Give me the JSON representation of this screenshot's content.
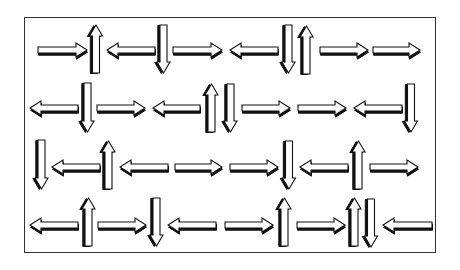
{
  "diagram": {
    "title": "",
    "colors": {
      "fill": "#ffffff",
      "outline": "#111111",
      "shadow": "#111111",
      "frame": "#333333",
      "background": "#ffffff"
    },
    "frame": {
      "x": 24,
      "y": 17,
      "w": 412,
      "h": 236
    },
    "rows": [
      {
        "cy": 50,
        "arrows": [
          {
            "dir": "right",
            "x0": 38,
            "x1": 87
          },
          {
            "dir": "up",
            "x0": 90,
            "x1": 102,
            "y0": 25,
            "y1": 73
          },
          {
            "dir": "left",
            "x0": 107,
            "x1": 155
          },
          {
            "dir": "down",
            "x0": 157,
            "x1": 170,
            "y0": 25,
            "y1": 73
          },
          {
            "dir": "right",
            "x0": 173,
            "x1": 222
          },
          {
            "dir": "left",
            "x0": 230,
            "x1": 278
          },
          {
            "dir": "down",
            "x0": 282,
            "x1": 295,
            "y0": 25,
            "y1": 73
          },
          {
            "dir": "up",
            "x0": 300,
            "x1": 313,
            "y0": 26,
            "y1": 74
          },
          {
            "dir": "right",
            "x0": 320,
            "x1": 368
          },
          {
            "dir": "right",
            "x0": 373,
            "x1": 420
          }
        ]
      },
      {
        "cy": 108,
        "arrows": [
          {
            "dir": "left",
            "x0": 30,
            "x1": 78
          },
          {
            "dir": "down",
            "x0": 81,
            "x1": 94,
            "y0": 83,
            "y1": 132
          },
          {
            "dir": "right",
            "x0": 97,
            "x1": 145
          },
          {
            "dir": "left",
            "x0": 153,
            "x1": 200
          },
          {
            "dir": "up",
            "x0": 205,
            "x1": 218,
            "y0": 84,
            "y1": 132
          },
          {
            "dir": "down",
            "x0": 224,
            "x1": 237,
            "y0": 84,
            "y1": 132
          },
          {
            "dir": "right",
            "x0": 242,
            "x1": 290
          },
          {
            "dir": "right",
            "x0": 298,
            "x1": 346
          },
          {
            "dir": "left",
            "x0": 354,
            "x1": 402
          },
          {
            "dir": "down",
            "x0": 404,
            "x1": 418,
            "y0": 84,
            "y1": 132
          }
        ]
      },
      {
        "cy": 167,
        "arrows": [
          {
            "dir": "down",
            "x0": 35,
            "x1": 48,
            "y0": 140,
            "y1": 189
          },
          {
            "dir": "left",
            "x0": 52,
            "x1": 100
          },
          {
            "dir": "up",
            "x0": 102,
            "x1": 115,
            "y0": 141,
            "y1": 189
          },
          {
            "dir": "left",
            "x0": 120,
            "x1": 168
          },
          {
            "dir": "right",
            "x0": 175,
            "x1": 222
          },
          {
            "dir": "right",
            "x0": 230,
            "x1": 278
          },
          {
            "dir": "down",
            "x0": 282,
            "x1": 296,
            "y0": 141,
            "y1": 189
          },
          {
            "dir": "left",
            "x0": 300,
            "x1": 348
          },
          {
            "dir": "up",
            "x0": 352,
            "x1": 365,
            "y0": 141,
            "y1": 189
          },
          {
            "dir": "right",
            "x0": 370,
            "x1": 418
          }
        ]
      },
      {
        "cy": 225,
        "arrows": [
          {
            "dir": "left",
            "x0": 30,
            "x1": 78
          },
          {
            "dir": "up",
            "x0": 82,
            "x1": 95,
            "y0": 198,
            "y1": 246
          },
          {
            "dir": "right",
            "x0": 98,
            "x1": 146
          },
          {
            "dir": "down",
            "x0": 150,
            "x1": 163,
            "y0": 198,
            "y1": 246
          },
          {
            "dir": "left",
            "x0": 168,
            "x1": 216
          },
          {
            "dir": "right",
            "x0": 225,
            "x1": 273
          },
          {
            "dir": "up",
            "x0": 278,
            "x1": 291,
            "y0": 198,
            "y1": 246
          },
          {
            "dir": "right",
            "x0": 297,
            "x1": 345
          },
          {
            "dir": "up",
            "x0": 348,
            "x1": 361,
            "y0": 198,
            "y1": 246
          },
          {
            "dir": "down",
            "x0": 364,
            "x1": 378,
            "y0": 199,
            "y1": 247
          },
          {
            "dir": "left",
            "x0": 383,
            "x1": 432
          }
        ]
      }
    ]
  }
}
